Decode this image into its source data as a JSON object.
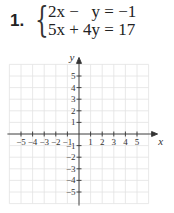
{
  "problem": {
    "number": "1.",
    "equations": [
      "2x −   y = −1",
      "5x + 4y = 17"
    ]
  },
  "graph": {
    "x_label": "x",
    "y_label": "y",
    "x_ticks": [
      "−5",
      "−4",
      "−3",
      "−2",
      "−1",
      "1",
      "2",
      "3",
      "4",
      "5"
    ],
    "y_ticks": [
      "5",
      "4",
      "3",
      "2",
      "1",
      "−1",
      "−2",
      "−3",
      "−4",
      "−5"
    ],
    "grid_color": "#e4e4e4",
    "axis_color": "#333333"
  }
}
